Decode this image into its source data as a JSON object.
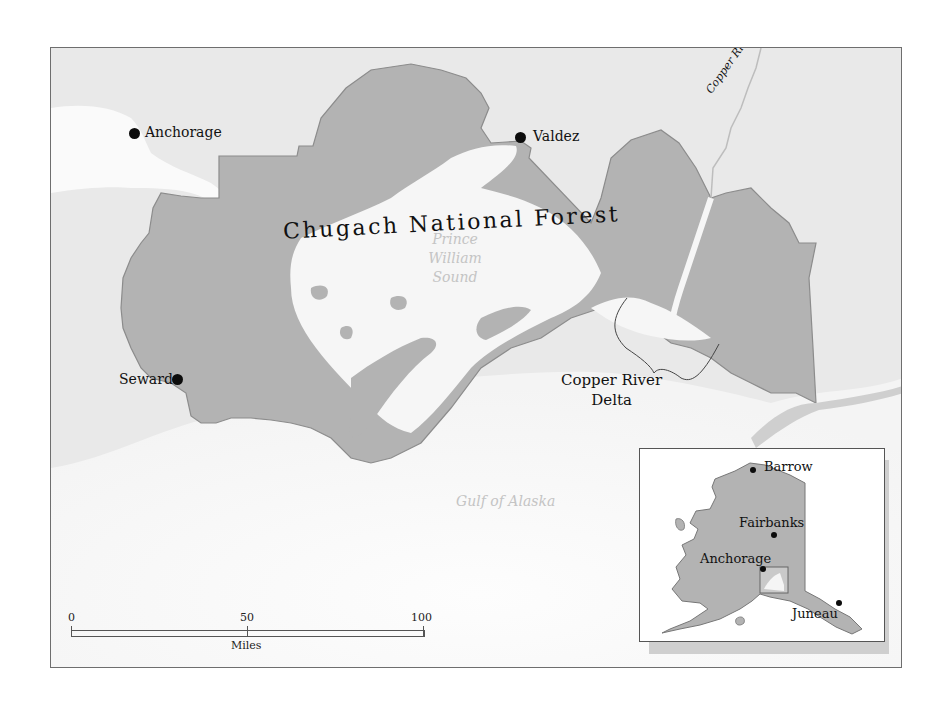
{
  "map": {
    "title": "Chugach National Forest",
    "colors": {
      "forest_fill": "#b3b3b3",
      "forest_border": "#8c8c8c",
      "land": "#e6e6e6",
      "water": "#fafafa",
      "frame": "#6e6e6e",
      "water_label": "#c4c4c4"
    },
    "cities": [
      {
        "name": "Anchorage",
        "icon": "city-dot-icon"
      },
      {
        "name": "Valdez",
        "icon": "city-dot-icon"
      },
      {
        "name": "Seward",
        "icon": "city-dot-icon"
      }
    ],
    "water_bodies": {
      "sound_line1": "Prince",
      "sound_line2": "William",
      "sound_line3": "Sound",
      "gulf": "Gulf of Alaska"
    },
    "river": "Copper River",
    "delta": {
      "line1": "Copper River",
      "line2": "Delta"
    },
    "scale_bar": {
      "ticks": [
        "0",
        "50",
        "100"
      ],
      "unit": "Miles"
    },
    "inset": {
      "cities": [
        {
          "name": "Barrow"
        },
        {
          "name": "Fairbanks"
        },
        {
          "name": "Anchorage"
        },
        {
          "name": "Juneau"
        }
      ],
      "highlight_label": "locator-box"
    }
  }
}
